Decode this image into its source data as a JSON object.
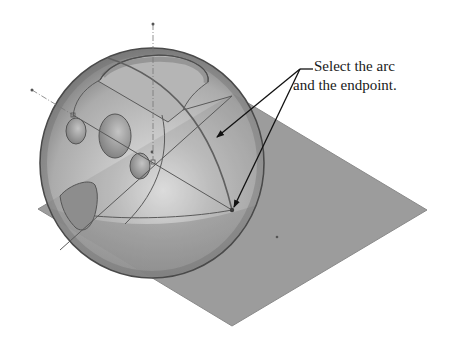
{
  "figure": {
    "callout": {
      "line1": "Select the arc",
      "line2": "and the endpoint."
    },
    "colors": {
      "background": "#ffffff",
      "plane_fill": "#9a9a9a",
      "sphere_fill": "#b8b8b8",
      "sphere_edge": "#4a4a4a",
      "sketch_line": "#5a5a5a",
      "leader": "#111111"
    },
    "elements": {
      "plane": "reference-plane",
      "sphere": "sphere-body",
      "selected_arc": "arc",
      "selected_point": "endpoint",
      "holes": [
        "hole-1",
        "hole-2",
        "hole-3"
      ],
      "top_cut": "top-pocket",
      "side_cut": "side-pocket"
    }
  }
}
